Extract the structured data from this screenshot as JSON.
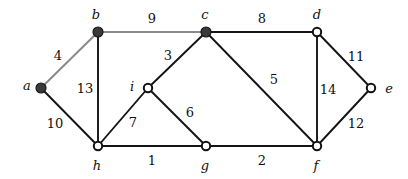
{
  "figure": {
    "name": "weighted-undirected-graph",
    "width": 408,
    "height": 179,
    "background": "#ffffff",
    "edge_color_default": "#141414",
    "edge_color_light": "#8a8a8a",
    "vertex_fill_filled": "#3a3a3a",
    "vertex_fill_hollow": "#ffffff",
    "vertex_stroke": "#111111"
  },
  "vertices": [
    {
      "id": "a",
      "label": "a",
      "x": 41,
      "y": 88,
      "filled": true,
      "label_x": 27,
      "label_y": 85
    },
    {
      "id": "b",
      "label": "b",
      "x": 98,
      "y": 32,
      "filled": true,
      "label_x": 96,
      "label_y": 14
    },
    {
      "id": "c",
      "label": "c",
      "x": 206,
      "y": 32,
      "filled": true,
      "label_x": 205,
      "label_y": 14
    },
    {
      "id": "d",
      "label": "d",
      "x": 317,
      "y": 32,
      "filled": false,
      "label_x": 317,
      "label_y": 14
    },
    {
      "id": "e",
      "label": "e",
      "x": 371,
      "y": 88,
      "filled": false,
      "label_x": 389,
      "label_y": 88
    },
    {
      "id": "f",
      "label": "f",
      "x": 317,
      "y": 146,
      "filled": false,
      "label_x": 316,
      "label_y": 165
    },
    {
      "id": "g",
      "label": "g",
      "x": 206,
      "y": 146,
      "filled": false,
      "label_x": 205,
      "label_y": 165
    },
    {
      "id": "h",
      "label": "h",
      "x": 98,
      "y": 146,
      "filled": false,
      "label_x": 97,
      "label_y": 165
    },
    {
      "id": "i",
      "label": "i",
      "x": 148,
      "y": 88,
      "filled": false,
      "label_x": 132,
      "label_y": 86
    }
  ],
  "edges": [
    {
      "id": "a-b",
      "from": "a",
      "to": "b",
      "weight": "4",
      "light": true,
      "label_x": 58,
      "label_y": 55
    },
    {
      "id": "a-h",
      "from": "a",
      "to": "h",
      "weight": "10",
      "light": false,
      "label_x": 55,
      "label_y": 123
    },
    {
      "id": "b-h",
      "from": "b",
      "to": "h",
      "weight": "13",
      "light": false,
      "label_x": 85,
      "label_y": 88
    },
    {
      "id": "b-c",
      "from": "b",
      "to": "c",
      "weight": "9",
      "light": true,
      "label_x": 152,
      "label_y": 18
    },
    {
      "id": "c-d",
      "from": "c",
      "to": "d",
      "weight": "8",
      "light": false,
      "label_x": 262,
      "label_y": 18
    },
    {
      "id": "c-i",
      "from": "c",
      "to": "i",
      "weight": "3",
      "light": false,
      "label_x": 168,
      "label_y": 55
    },
    {
      "id": "c-f",
      "from": "c",
      "to": "f",
      "weight": "5",
      "light": false,
      "label_x": 274,
      "label_y": 79
    },
    {
      "id": "d-e",
      "from": "d",
      "to": "e",
      "weight": "11",
      "light": false,
      "label_x": 356,
      "label_y": 56
    },
    {
      "id": "d-f",
      "from": "d",
      "to": "f",
      "weight": "14",
      "light": false,
      "label_x": 328,
      "label_y": 89
    },
    {
      "id": "e-f",
      "from": "e",
      "to": "f",
      "weight": "12",
      "light": false,
      "label_x": 356,
      "label_y": 123
    },
    {
      "id": "f-g",
      "from": "f",
      "to": "g",
      "weight": "2",
      "light": false,
      "label_x": 262,
      "label_y": 160
    },
    {
      "id": "g-h",
      "from": "g",
      "to": "h",
      "weight": "1",
      "light": false,
      "label_x": 152,
      "label_y": 160
    },
    {
      "id": "g-i",
      "from": "g",
      "to": "i",
      "weight": "6",
      "light": false,
      "label_x": 190,
      "label_y": 112
    },
    {
      "id": "h-i",
      "from": "h",
      "to": "i",
      "weight": "7",
      "light": false,
      "label_x": 133,
      "label_y": 122
    }
  ]
}
